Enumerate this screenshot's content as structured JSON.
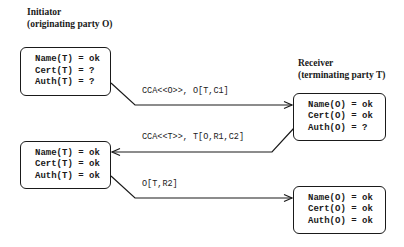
{
  "initiator": {
    "title": "Initiator",
    "subtitle": "(originating party O)"
  },
  "receiver": {
    "title": "Receiver",
    "subtitle": "(terminating party T)"
  },
  "states": {
    "initiator_before": [
      "Name(T) = ok",
      "Cert(T) = ?",
      "Auth(T) = ?"
    ],
    "receiver_after_msg1": [
      "Name(O) = ok",
      "Cert(O) = ok",
      "Auth(O) = ?"
    ],
    "initiator_after_msg2": [
      "Name(T) = ok",
      "Cert(T) = ok",
      "Auth(T) = ok"
    ],
    "receiver_after_msg3": [
      "Name(O) = ok",
      "Cert(O) = ok",
      "Auth(O) = ok"
    ]
  },
  "messages": [
    {
      "label": "CCA<<O>>, O[T,C1]",
      "direction": "initiator-to-receiver"
    },
    {
      "label": "CCA<<T>>, T[O,R1,C2]",
      "direction": "receiver-to-initiator"
    },
    {
      "label": "O[T,R2]",
      "direction": "initiator-to-receiver"
    }
  ],
  "colors": {
    "ink": "#1a1a1a",
    "background": "#ffffff"
  }
}
